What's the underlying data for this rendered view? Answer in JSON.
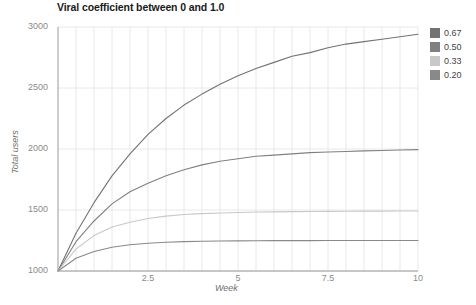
{
  "chart_data": {
    "type": "line",
    "title": "Viral coefficient between 0 and 1.0",
    "xlabel": "Week",
    "ylabel": "Total users",
    "xlim": [
      0,
      10
    ],
    "ylim": [
      1000,
      3000
    ],
    "xticks": [
      "2.5",
      "5",
      "7.5",
      "10"
    ],
    "xtick_values": [
      2.5,
      5,
      7.5,
      10
    ],
    "yticks": [
      "1000",
      "1500",
      "2000",
      "2500",
      "3000"
    ],
    "ytick_values": [
      1000,
      1500,
      2000,
      2500,
      3000
    ],
    "grid": true,
    "legend_position": "right",
    "x": [
      0,
      0.5,
      1,
      1.5,
      2,
      2.5,
      3,
      3.5,
      4,
      4.5,
      5,
      5.5,
      6,
      6.5,
      7,
      7.5,
      8,
      8.5,
      9,
      9.5,
      10
    ],
    "series": [
      {
        "name": "0.67",
        "color": "#737373",
        "asymptote": 3030,
        "values": [
          1000,
          1310,
          1560,
          1780,
          1960,
          2120,
          2250,
          2360,
          2450,
          2530,
          2600,
          2660,
          2710,
          2760,
          2790,
          2830,
          2860,
          2880,
          2900,
          2920,
          2940
        ]
      },
      {
        "name": "0.50",
        "color": "#808080",
        "asymptote": 2000,
        "values": [
          1000,
          1240,
          1410,
          1550,
          1650,
          1720,
          1780,
          1830,
          1870,
          1900,
          1920,
          1940,
          1950,
          1960,
          1970,
          1975,
          1980,
          1985,
          1988,
          1992,
          1995
        ]
      },
      {
        "name": "0.33",
        "color": "#c8c8c8",
        "asymptote": 1493,
        "values": [
          1000,
          1180,
          1290,
          1360,
          1400,
          1430,
          1450,
          1463,
          1470,
          1476,
          1480,
          1483,
          1485,
          1487,
          1488,
          1489,
          1490,
          1491,
          1491,
          1492,
          1492
        ]
      },
      {
        "name": "0.20",
        "color": "#898989",
        "asymptote": 1250,
        "values": [
          1000,
          1105,
          1160,
          1195,
          1215,
          1228,
          1236,
          1241,
          1244,
          1246,
          1247,
          1248,
          1249,
          1249,
          1249,
          1250,
          1250,
          1250,
          1250,
          1250,
          1250
        ]
      }
    ]
  },
  "axes": {
    "spine_color": "#9a9a9a",
    "grid_color": "#e8e8e8"
  }
}
